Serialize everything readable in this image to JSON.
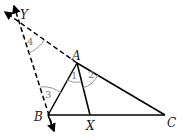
{
  "diagram": {
    "type": "geometry",
    "points": {
      "Y": {
        "label": "Y",
        "x": 16,
        "y": 20
      },
      "A": {
        "label": "A",
        "x": 77,
        "y": 63
      },
      "B": {
        "label": "B",
        "x": 48,
        "y": 115
      },
      "X": {
        "label": "X",
        "x": 90,
        "y": 115
      },
      "C": {
        "label": "C",
        "x": 165,
        "y": 115
      }
    },
    "angles": [
      {
        "label": "1",
        "vertex": "A"
      },
      {
        "label": "2",
        "vertex": "A"
      },
      {
        "label": "3",
        "vertex": "B"
      },
      {
        "label": "4",
        "vertex": "Y"
      }
    ],
    "segments_solid": [
      "AB",
      "AC",
      "BC",
      "AX"
    ],
    "segments_dashed": [
      "AY",
      "BY"
    ],
    "colors": {
      "line": "#000000",
      "angle_arc": "#999999",
      "angle_label": "#777777"
    }
  }
}
